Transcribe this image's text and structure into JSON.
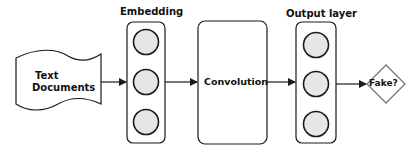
{
  "diagram": {
    "title_labels": {
      "embedding": "Embedding",
      "output_layer": "Output layer"
    },
    "nodes": {
      "input": {
        "line1": "Text",
        "line2": "Documents",
        "shape": "document-wave"
      },
      "embedding": {
        "label": "Embedding",
        "neuron_count": 3,
        "shape": "rounded-column"
      },
      "convolution": {
        "label": "Convolution",
        "shape": "rounded-rectangle"
      },
      "output": {
        "label": "Output layer",
        "neuron_count": 3,
        "shape": "rounded-column"
      },
      "decision": {
        "label": "Fake?",
        "shape": "diamond"
      }
    },
    "edges": [
      {
        "from": "Text Documents",
        "to": "Embedding"
      },
      {
        "from": "Embedding",
        "to": "Convolution"
      },
      {
        "from": "Convolution",
        "to": "Output layer"
      },
      {
        "from": "Output layer",
        "to": "Fake?"
      }
    ],
    "colors": {
      "stroke": "#1a1a1a",
      "neuron_fill": "#e6e6e6",
      "diamond_stroke": "#777777",
      "text": "#111111",
      "background": "#ffffff"
    }
  }
}
